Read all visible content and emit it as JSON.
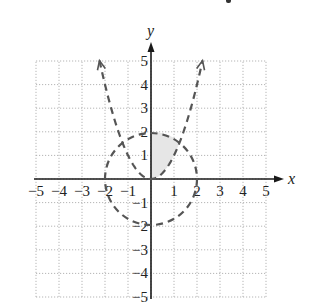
{
  "chart_data": {
    "type": "line",
    "title": "",
    "xlabel": "x",
    "ylabel": "y",
    "xlim": [
      -5,
      5
    ],
    "ylim": [
      -5,
      5
    ],
    "grid": true,
    "grid_style": "dotted",
    "x_ticks": [
      -5,
      -4,
      -3,
      -2,
      -1,
      1,
      2,
      3,
      4,
      5
    ],
    "y_ticks": [
      -5,
      -4,
      -3,
      -2,
      -1,
      1,
      2,
      3,
      4,
      5
    ],
    "x_tick_labels": [
      "−5",
      "−4",
      "−3",
      "−2",
      "−1",
      "1",
      "2",
      "3",
      "4",
      "5"
    ],
    "y_tick_labels": [
      "−5",
      "−4",
      "−3",
      "−2",
      "−1",
      "1",
      "2",
      "3",
      "4",
      "5"
    ],
    "series": [
      {
        "name": "circle x^2 + y^2 = 4",
        "kind": "circle",
        "center": [
          0,
          0
        ],
        "radius": 2,
        "line_style": "dashed"
      },
      {
        "name": "parabola y = x^2",
        "kind": "parabola",
        "x_range": [
          -2.24,
          2.24
        ],
        "line_style": "dashed",
        "arrows": "both-ends-up",
        "points": [
          [
            -2.24,
            5
          ],
          [
            -2,
            4
          ],
          [
            -1.5,
            2.25
          ],
          [
            -1,
            1
          ],
          [
            -0.5,
            0.25
          ],
          [
            0,
            0
          ],
          [
            0.5,
            0.25
          ],
          [
            1,
            1
          ],
          [
            1.5,
            2.25
          ],
          [
            2,
            4
          ],
          [
            2.24,
            5
          ]
        ]
      }
    ],
    "shaded_region": {
      "description": "x >= 0, y > x^2, x^2 + y^2 < 4",
      "fill": "#e6e6e6",
      "vertices_approx": [
        [
          0,
          0
        ],
        [
          0,
          2
        ],
        [
          0.5,
          1.94
        ],
        [
          0.79,
          1.25
        ],
        [
          0.5,
          0.25
        ],
        [
          0,
          0
        ]
      ]
    },
    "intersections": [
      [
        -1.25,
        1.56
      ],
      [
        1.25,
        1.56
      ]
    ]
  },
  "colors": {
    "background": "#ffffff",
    "axis": "#1a1a1a",
    "grid": "#b5b5b5",
    "curve": "#555555",
    "shade": "#e6e6e6",
    "text": "#222222"
  }
}
